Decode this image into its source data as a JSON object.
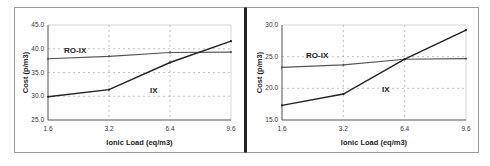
{
  "chart_data": [
    {
      "type": "line",
      "title": "",
      "xlabel": "Ionic Load (eq/m3)",
      "ylabel": "Cost (p/m3)",
      "x": [
        1.6,
        3.2,
        6.4,
        9.6
      ],
      "x_tick_labels": [
        "1.6",
        "3.2",
        "6.4",
        "9.6"
      ],
      "y_tick_labels": [
        "25.0",
        "30.0",
        "35.0",
        "40.0",
        "45.0"
      ],
      "ylim": [
        25,
        45
      ],
      "grid": true,
      "legend_position": "inline labels",
      "series": [
        {
          "name": "RO-IX",
          "values": [
            37.9,
            38.4,
            39.2,
            39.3
          ],
          "color": "#555555"
        },
        {
          "name": "IX",
          "values": [
            29.9,
            31.4,
            37.1,
            41.6
          ],
          "color": "#222222"
        }
      ]
    },
    {
      "type": "line",
      "title": "",
      "xlabel": "Ionic Load (eq/m3)",
      "ylabel": "Cost (p/m3)",
      "x": [
        1.6,
        3.2,
        6.4,
        9.6
      ],
      "x_tick_labels": [
        "1.6",
        "3.2",
        "6.4",
        "9.6"
      ],
      "y_tick_labels": [
        "15.0",
        "20.0",
        "25.0",
        "30.0"
      ],
      "ylim": [
        15,
        30
      ],
      "grid": true,
      "legend_position": "inline labels",
      "series": [
        {
          "name": "RO-IX",
          "values": [
            23.3,
            23.7,
            24.6,
            24.7
          ],
          "color": "#555555"
        },
        {
          "name": "IX",
          "values": [
            17.3,
            19.1,
            24.6,
            29.2
          ],
          "color": "#222222"
        }
      ]
    }
  ],
  "panels": {
    "left": {
      "xlabel": "Ionic Load (eq/m3)",
      "ylabel": "Cost (p/m3)",
      "label_roix": "RO-IX",
      "label_ix": "IX"
    },
    "right": {
      "xlabel": "Ionic Load (eq/m3)",
      "ylabel": "Cost (p/m3)",
      "label_roix": "RO-IX",
      "label_ix": "IX"
    }
  }
}
